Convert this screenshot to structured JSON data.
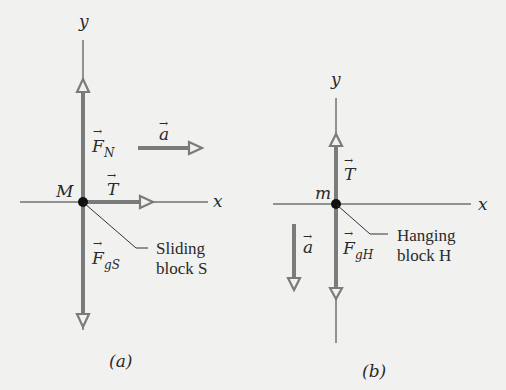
{
  "figure": {
    "panels": [
      {
        "id": "a",
        "caption": "(a)",
        "axes": {
          "x_label": "x",
          "y_label": "y"
        },
        "particle_label": "M",
        "callout": {
          "line1": "Sliding",
          "line2": "block S"
        },
        "vectors": [
          {
            "name": "F_N",
            "symbol": "F",
            "subscript": "N",
            "direction": "up"
          },
          {
            "name": "T",
            "symbol": "T",
            "subscript": "",
            "direction": "right"
          },
          {
            "name": "F_gS",
            "symbol": "F",
            "subscript": "gS",
            "direction": "down"
          },
          {
            "name": "a",
            "symbol": "a",
            "subscript": "",
            "direction": "right"
          }
        ]
      },
      {
        "id": "b",
        "caption": "(b)",
        "axes": {
          "x_label": "x",
          "y_label": "y"
        },
        "particle_label": "m",
        "callout": {
          "line1": "Hanging",
          "line2": "block H"
        },
        "vectors": [
          {
            "name": "T",
            "symbol": "T",
            "subscript": "",
            "direction": "up"
          },
          {
            "name": "F_gH",
            "symbol": "F",
            "subscript": "gH",
            "direction": "down"
          },
          {
            "name": "a",
            "symbol": "a",
            "subscript": "",
            "direction": "down"
          }
        ]
      }
    ],
    "colors": {
      "background": "#f1f1ef",
      "vector": "#7b7b7b",
      "axis": "#333333",
      "dot": "#111111"
    }
  }
}
